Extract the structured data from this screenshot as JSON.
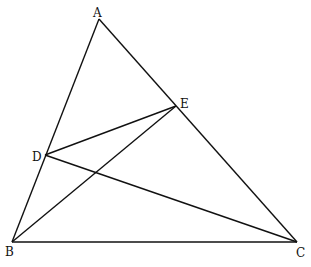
{
  "diagram": {
    "type": "triangle-geometry",
    "points": {
      "A": {
        "label": "A",
        "x": 99,
        "y": 19,
        "lx": 93,
        "ly": 7
      },
      "B": {
        "label": "B",
        "x": 12,
        "y": 242,
        "lx": 5,
        "ly": 246
      },
      "C": {
        "label": "C",
        "x": 297,
        "y": 242,
        "lx": 296,
        "ly": 247
      },
      "D": {
        "label": "D",
        "x": 45,
        "y": 155,
        "lx": 32,
        "ly": 151
      },
      "E": {
        "label": "E",
        "x": 176,
        "y": 106,
        "lx": 180,
        "ly": 98
      }
    },
    "segments": [
      "AB",
      "AC",
      "BC",
      "DE",
      "BE",
      "DC"
    ],
    "stroke_color": "#111111"
  }
}
